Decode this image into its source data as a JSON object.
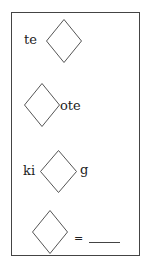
{
  "puzzle": {
    "rows": [
      {
        "left": "te",
        "right": ""
      },
      {
        "left": "",
        "right": "ote"
      },
      {
        "left": "ki",
        "right": "g"
      },
      {
        "left": "",
        "right": "="
      }
    ],
    "answer_blank": "____"
  },
  "colors": {
    "border": "#444444",
    "text": "#222222",
    "diamond": "#555555"
  }
}
